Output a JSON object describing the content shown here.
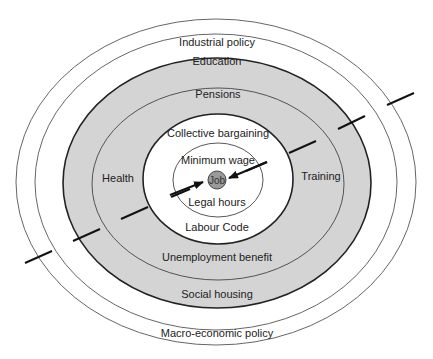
{
  "diagram": {
    "center": {
      "x": 216,
      "y": 180
    },
    "colors": {
      "ring_fill": "#d4d4d4",
      "job_fill": "#9a9a9a",
      "line": "#222222",
      "thin_line": "#555555"
    },
    "rings": [
      {
        "label": "Macro-economic policy",
        "rx": 200,
        "ry": 163
      },
      {
        "label": "Industrial policy",
        "rx": 181,
        "ry": 148
      },
      {
        "label": "Education / Social housing",
        "rx": 154,
        "ry": 125
      },
      {
        "label": "Pensions / Unemployment benefit",
        "rx": 126,
        "ry": 96
      },
      {
        "label": "Collective bargaining / Labour Code",
        "rx": 75,
        "ry": 65
      },
      {
        "label": "Minimum wage / Legal hours",
        "rx": 45,
        "ry": 37
      }
    ],
    "labels": {
      "industrial_policy": "Industrial policy",
      "education": "Education",
      "pensions": "Pensions",
      "collective_bargaining": "Collective bargaining",
      "minimum_wage": "Minimum wage",
      "job": "Job",
      "legal_hours": "Legal hours",
      "labour_code": "Labour Code",
      "unemployment_benefit": "Unemployment benefit",
      "social_housing": "Social housing",
      "macro_economic_policy": "Macro-economic policy",
      "health": "Health",
      "training": "Training"
    }
  }
}
